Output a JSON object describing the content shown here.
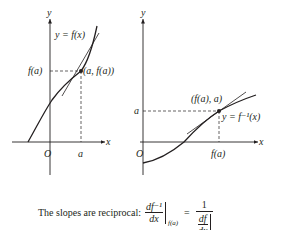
{
  "left_graph": {
    "y_axis_label": "y",
    "x_axis_label": "x",
    "origin_label": "O",
    "x_tick_label": "a",
    "y_tick_label": "f(a)",
    "curve_label": "y = f(x)",
    "point_label": "(a, f(a))"
  },
  "right_graph": {
    "y_axis_label": "y",
    "x_axis_label": "x",
    "origin_label": "O",
    "x_tick_label": "f(a)",
    "y_tick_label": "a",
    "curve_label": "y = f⁻¹(x)",
    "point_label": "(f(a), a)"
  },
  "caption": {
    "text": "The slopes are reciprocal:",
    "lhs_numerator": "df⁻¹",
    "lhs_denominator": "dx",
    "lhs_eval_at": "f(a)",
    "equals": "=",
    "rhs_numerator": "1",
    "rhs_inner_numerator": "df",
    "rhs_inner_denominator": "dx",
    "rhs_eval_at": "a"
  },
  "colors": {
    "ink": "#231f20",
    "background": "#ffffff"
  }
}
